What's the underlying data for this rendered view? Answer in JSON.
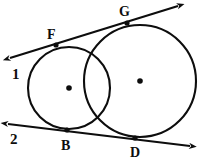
{
  "figure": {
    "width": 204,
    "height": 161,
    "background_color": "#ffffff",
    "ink_color": "#0d0d0d"
  },
  "labels": {
    "line1": "1",
    "line2": "2",
    "point_f": "F",
    "point_g": "G",
    "point_b": "B",
    "point_d": "D"
  },
  "geometry": {
    "small_circle": {
      "cx": 69,
      "cy": 88,
      "r": 41
    },
    "large_circle": {
      "cx": 140,
      "cy": 81,
      "r": 56
    },
    "tangent_line_1": {
      "x1": 10,
      "y1": 58,
      "x2": 178,
      "y2": 6
    },
    "tangent_line_2": {
      "x1": 8,
      "y1": 124,
      "x2": 190,
      "y2": 146
    },
    "points": {
      "F": {
        "x": 56,
        "y": 45
      },
      "G": {
        "x": 127,
        "y": 23
      },
      "B": {
        "x": 67,
        "y": 130
      },
      "D": {
        "x": 135,
        "y": 138
      },
      "small_center": {
        "x": 69,
        "y": 88
      },
      "large_center": {
        "x": 140,
        "y": 81
      }
    },
    "label_positions": {
      "line1": {
        "x": 12,
        "y": 79
      },
      "line2": {
        "x": 10,
        "y": 144
      },
      "F": {
        "x": 47,
        "y": 39
      },
      "G": {
        "x": 119,
        "y": 16
      },
      "B": {
        "x": 66,
        "y": 150
      },
      "D": {
        "x": 136,
        "y": 157
      }
    }
  }
}
